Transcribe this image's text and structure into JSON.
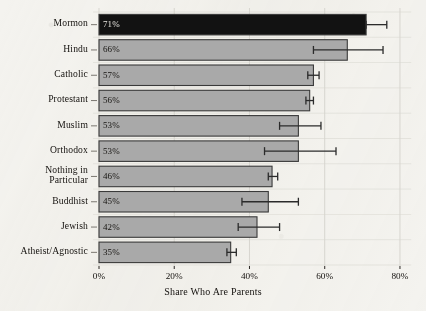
{
  "chart_data": {
    "type": "bar",
    "orientation": "horizontal",
    "title": "",
    "xlabel": "Share Who Are Parents",
    "ylabel": "",
    "xlim": [
      0,
      83
    ],
    "xticks": [
      0,
      20,
      40,
      60,
      80
    ],
    "xtick_labels": [
      "0%",
      "20%",
      "40%",
      "60%",
      "80%"
    ],
    "grid": true,
    "legend": null,
    "value_label_suffix": "%",
    "categories": [
      "Mormon",
      "Hindu",
      "Catholic",
      "Protestant",
      "Muslim",
      "Orthodox",
      "Nothing in\nParticular",
      "Buddhist",
      "Jewish",
      "Atheist/Agnostic"
    ],
    "values": [
      71,
      66,
      57,
      56,
      53,
      53,
      46,
      45,
      42,
      35
    ],
    "value_labels": [
      "71%",
      "66%",
      "57%",
      "56%",
      "53%",
      "53%",
      "46%",
      "45%",
      "42%",
      "35%"
    ],
    "error_bars": [
      {
        "category": "Mormon",
        "low": 71.0,
        "high": 76.5
      },
      {
        "category": "Hindu",
        "low": 57.0,
        "high": 75.5
      },
      {
        "category": "Catholic",
        "low": 55.5,
        "high": 58.5
      },
      {
        "category": "Protestant",
        "low": 55.0,
        "high": 57.0
      },
      {
        "category": "Muslim",
        "low": 48.0,
        "high": 59.0
      },
      {
        "category": "Orthodox",
        "low": 44.0,
        "high": 63.0
      },
      {
        "category": "Nothing in Particular",
        "low": 45.0,
        "high": 47.5
      },
      {
        "category": "Buddhist",
        "low": 38.0,
        "high": 53.0
      },
      {
        "category": "Jewish",
        "low": 37.0,
        "high": 48.0
      },
      {
        "category": "Atheist/Agnostic",
        "low": 34.0,
        "high": 36.5
      }
    ],
    "bar_colors": [
      "#121212",
      "#a9a9a9",
      "#a9a9a9",
      "#a9a9a9",
      "#a9a9a9",
      "#a9a9a9",
      "#a9a9a9",
      "#a9a9a9",
      "#a9a9a9",
      "#a9a9a9"
    ],
    "highlight_category": "Mormon",
    "bar_edge_color": "#3a3a3a",
    "gridline_color": "#d7d5cf",
    "errorbar_color": "#2b2b2b",
    "background_color": "#f4f3ef",
    "text_color": "#14110e"
  }
}
